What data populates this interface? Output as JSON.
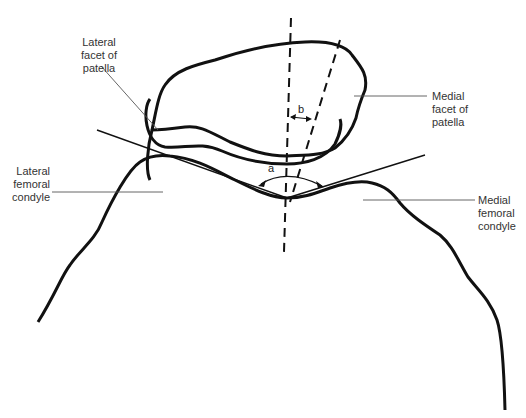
{
  "diagram": {
    "labels": {
      "lateral_facet": "Lateral\nfacet of\npatella",
      "medial_facet": "Medial\nfacet of\npatella",
      "lateral_condyle": "Lateral\nfemoral\ncondyle",
      "medial_condyle": "Medial\nfemoral\ncondyle"
    },
    "angles": {
      "a": "a",
      "b": "b"
    },
    "colors": {
      "outline": "#111111",
      "leader": "#555555",
      "text": "#333333"
    }
  }
}
